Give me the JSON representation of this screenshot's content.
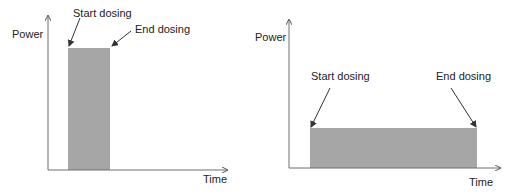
{
  "colors": {
    "axis": "#6e6e6e",
    "fill": "#a6a6a6",
    "arrow": "#333333",
    "text": "#222222"
  },
  "left": {
    "y_label": "Power",
    "x_label": "Time",
    "start_label": "Start dosing",
    "end_label": "End dosing",
    "description": "Short, high-power dose"
  },
  "right": {
    "y_label": "Power",
    "x_label": "Time",
    "start_label": "Start dosing",
    "end_label": "End dosing",
    "description": "Long, low-power dose"
  }
}
